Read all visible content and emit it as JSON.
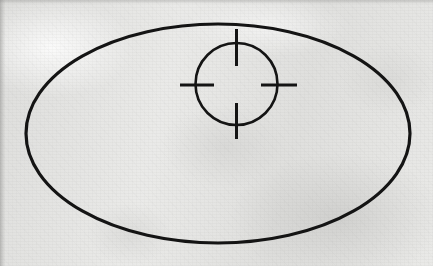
{
  "document": {
    "kind": "scanned-diagram",
    "caption": "",
    "page_background": "#e8e8e6",
    "ink_color": "#141414"
  },
  "figure": {
    "title": "",
    "canvas": {
      "width": 433,
      "height": 266
    },
    "shapes": [
      {
        "name": "outer-ellipse",
        "type": "ellipse",
        "cx": 218,
        "cy": 133.5,
        "rx": 192,
        "ry": 109.5,
        "stroke_width": 3.2,
        "stroke": "#141414",
        "fill": "none"
      },
      {
        "name": "crosshair-circle",
        "type": "circle",
        "cx": 236.5,
        "cy": 84,
        "r": 41,
        "stroke_width": 2.6,
        "stroke": "#141414",
        "fill": "none"
      }
    ],
    "crosshair_ticks": [
      {
        "name": "tick-top",
        "x1": 236.5,
        "y1": 29,
        "x2": 236.5,
        "y2": 66,
        "stroke_width": 3.0
      },
      {
        "name": "tick-bottom",
        "x1": 236.5,
        "y1": 103,
        "x2": 236.5,
        "y2": 139,
        "stroke_width": 3.0
      },
      {
        "name": "tick-left",
        "x1": 180,
        "y1": 85,
        "x2": 214,
        "y2": 85,
        "stroke_width": 3.0
      },
      {
        "name": "tick-right",
        "x1": 261,
        "y1": 85,
        "x2": 297,
        "y2": 85,
        "stroke_width": 3.0
      }
    ]
  },
  "chart_data": {
    "type": "scatter",
    "title": "",
    "xlabel": "",
    "ylabel": "",
    "annotations": [
      {
        "label": "outer-ellipse",
        "cx": 218,
        "cy": 133.5,
        "rx": 192,
        "ry": 109.5
      },
      {
        "label": "crosshair-target",
        "cx": 236.5,
        "cy": 84,
        "r": 41
      }
    ]
  }
}
